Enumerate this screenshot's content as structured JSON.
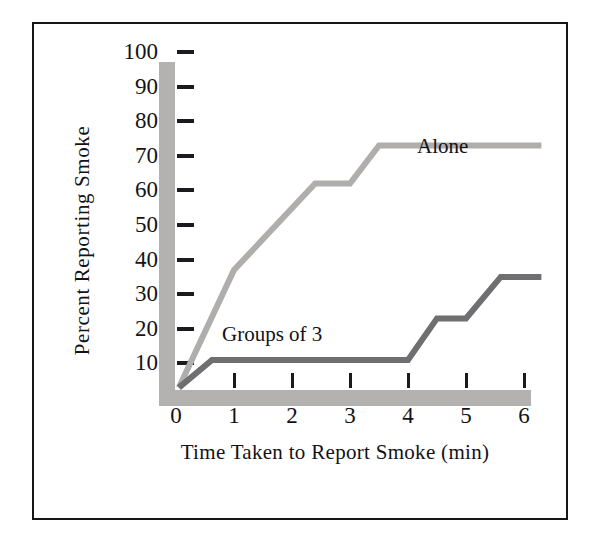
{
  "figure": {
    "border_color": "#16151a",
    "background": "#ffffff"
  },
  "chart_data": {
    "type": "line",
    "title": "",
    "xlabel": "Time Taken to Report Smoke (min)",
    "ylabel": "Percent Reporting Smoke",
    "xlim": [
      0,
      6.3
    ],
    "ylim": [
      0,
      105
    ],
    "xticks": [
      0,
      1,
      2,
      3,
      4,
      5,
      6
    ],
    "xtick_labels": [
      "0",
      "1",
      "2",
      "3",
      "4",
      "5",
      "6"
    ],
    "yticks": [
      10,
      20,
      30,
      40,
      50,
      60,
      70,
      80,
      90,
      100
    ],
    "ytick_labels": [
      "10",
      "20",
      "30",
      "40",
      "50",
      "60",
      "70",
      "80",
      "90",
      "100"
    ],
    "grid": false,
    "legend": "inline-labels",
    "axis_color": "#b4b2b0",
    "series": [
      {
        "name": "Alone",
        "color": "#b0aeac",
        "label_position": "above-right-of-plateau",
        "x": [
          0.05,
          1.0,
          2.4,
          3.0,
          3.5,
          6.3
        ],
        "y": [
          3,
          37,
          62,
          62,
          73,
          73
        ]
      },
      {
        "name": "Groups of 3",
        "color": "#6f6e70",
        "label_position": "above-left-of-line",
        "x": [
          0.05,
          0.62,
          4.0,
          4.5,
          5.0,
          5.6,
          6.3
        ],
        "y": [
          3,
          11,
          11,
          23,
          23,
          35,
          35
        ]
      }
    ]
  }
}
